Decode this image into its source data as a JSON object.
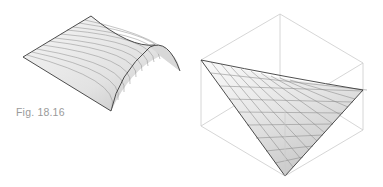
{
  "figure": {
    "caption": "Fig. 18.16",
    "left_drawing": "barrel-vault-saddle-surface",
    "right_drawing": "hyperbolic-paraboloid-in-cube",
    "colors": {
      "background": "#ffffff",
      "surface_fill_light": "#f4f4f4",
      "surface_fill_dark": "#cfcfcf",
      "edge_line": "#3a3a3a",
      "grid_line": "#8a8a8a",
      "cube_line": "#cccccc",
      "caption": "#9a9a9a"
    }
  }
}
